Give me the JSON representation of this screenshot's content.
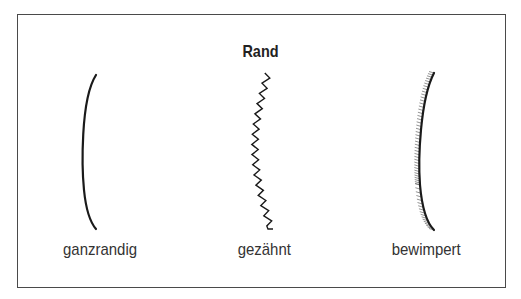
{
  "diagram": {
    "title": "Rand",
    "items": [
      {
        "id": "ganzrandig",
        "label": "ganzrandig",
        "edge_type": "smooth"
      },
      {
        "id": "gezaehnt",
        "label": "gezähnt",
        "edge_type": "serrated"
      },
      {
        "id": "bewimpert",
        "label": "bewimpert",
        "edge_type": "ciliate"
      }
    ]
  }
}
